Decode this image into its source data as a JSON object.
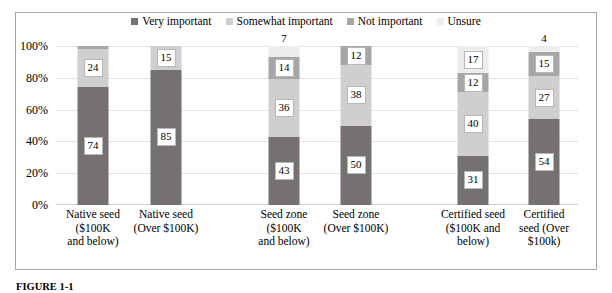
{
  "chart_data": {
    "type": "bar",
    "subtype": "stacked-percent",
    "title": "",
    "xlabel": "",
    "ylabel": "",
    "ylim": [
      0,
      100
    ],
    "ytick_labels": [
      "0%",
      "20%",
      "40%",
      "60%",
      "80%",
      "100%"
    ],
    "ytick_values": [
      0,
      20,
      40,
      60,
      80,
      100
    ],
    "grid": true,
    "legend_position": "top-center",
    "categories": [
      "Native seed ($100K and below)",
      "Native seed (Over $100K)",
      "Seed zone ($100K and below)",
      "Seed zone (Over $100K)",
      "Certified seed ($100K and below)",
      "Certified seed (Over $100k)"
    ],
    "category_lines": [
      [
        "Native seed",
        "($100K",
        "and below)"
      ],
      [
        "Native seed",
        "(Over $100K)"
      ],
      [
        "Seed zone",
        "($100K",
        "and below)"
      ],
      [
        "Seed zone",
        "(Over $100K)"
      ],
      [
        "Certified seed",
        "($100K and",
        "below)"
      ],
      [
        "Certified",
        "seed (Over",
        "$100k)"
      ]
    ],
    "series": [
      {
        "name": "Very important",
        "color": "#767171",
        "values": [
          74,
          85,
          43,
          50,
          31,
          54
        ]
      },
      {
        "name": "Somewhat important",
        "color": "#d0cece",
        "values": [
          24,
          15,
          36,
          38,
          40,
          27
        ]
      },
      {
        "name": "Not important",
        "color": "#a6a6a6",
        "values": [
          2,
          0,
          14,
          12,
          12,
          15
        ]
      },
      {
        "name": "Unsure",
        "color": "#ededed",
        "values": [
          0,
          0,
          7,
          0,
          17,
          4
        ]
      }
    ],
    "bar_labels": [
      [
        {
          "series": "Very important",
          "value": 74,
          "shown": true
        },
        {
          "series": "Somewhat important",
          "value": 24,
          "shown": true
        },
        {
          "series": "Not important",
          "value": 2,
          "shown": false
        },
        {
          "series": "Unsure",
          "value": 0,
          "shown": false
        }
      ],
      [
        {
          "series": "Very important",
          "value": 85,
          "shown": true
        },
        {
          "series": "Somewhat important",
          "value": 15,
          "shown": true
        },
        {
          "series": "Not important",
          "value": 0,
          "shown": false
        },
        {
          "series": "Unsure",
          "value": 0,
          "shown": false
        }
      ],
      [
        {
          "series": "Very important",
          "value": 43,
          "shown": true
        },
        {
          "series": "Somewhat important",
          "value": 36,
          "shown": true
        },
        {
          "series": "Not important",
          "value": 14,
          "shown": true
        },
        {
          "series": "Unsure",
          "value": 7,
          "shown": true
        }
      ],
      [
        {
          "series": "Very important",
          "value": 50,
          "shown": true
        },
        {
          "series": "Somewhat important",
          "value": 38,
          "shown": true
        },
        {
          "series": "Not important",
          "value": 12,
          "shown": true
        },
        {
          "series": "Unsure",
          "value": 0,
          "shown": false
        }
      ],
      [
        {
          "series": "Very important",
          "value": 31,
          "shown": true
        },
        {
          "series": "Somewhat important",
          "value": 40,
          "shown": true
        },
        {
          "series": "Not important",
          "value": 12,
          "shown": true
        },
        {
          "series": "Unsure",
          "value": 17,
          "shown": true
        }
      ],
      [
        {
          "series": "Very important",
          "value": 54,
          "shown": true
        },
        {
          "series": "Somewhat important",
          "value": 27,
          "shown": true
        },
        {
          "series": "Not important",
          "value": 15,
          "shown": true
        },
        {
          "series": "Unsure",
          "value": 4,
          "shown": true
        }
      ]
    ]
  },
  "legend": {
    "items": [
      {
        "label": "Very important",
        "color": "#767171"
      },
      {
        "label": "Somewhat important",
        "color": "#d0cece"
      },
      {
        "label": "Not important",
        "color": "#a6a6a6"
      },
      {
        "label": "Unsure",
        "color": "#ededed"
      }
    ]
  },
  "caption": {
    "prefix": "FIGURE 1-1",
    "text": ""
  },
  "colors": {
    "frame_border": "#a6a6a6",
    "gridline": "#e3e3e3",
    "plot_background": "#ffffff",
    "label_box_border": "#b7b7b7",
    "text": "#000000"
  }
}
